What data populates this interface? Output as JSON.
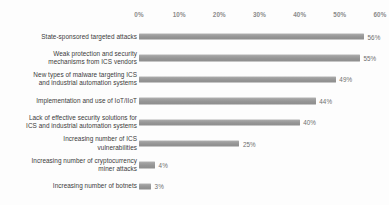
{
  "chart_data": {
    "type": "bar",
    "orientation": "horizontal",
    "title": "",
    "subtitle": "",
    "xlabel": "",
    "ylabel": "",
    "xlim": [
      0,
      60
    ],
    "grid": false,
    "legend": null,
    "axis_ticks": [
      "0%",
      "10%",
      "20%",
      "30%",
      "40%",
      "50%",
      "60%"
    ],
    "axis_tick_values": [
      0,
      10,
      20,
      30,
      40,
      50,
      60
    ],
    "axis_position": "top",
    "bar_color": "#9a9a9a",
    "label_color": "#3b3b3b",
    "tick_color": "#8b8b8b",
    "value_color": "#6f6f6f",
    "background": "#fdfdfd",
    "categories": [
      "State-sponsored targeted attacks",
      "Weak protection and security\nmechanisms from ICS vendors",
      "New types of malware targeting ICS\nand industrial automation systems",
      "Implementation and use of IoT/IIoT",
      "Lack of effective security solutions  for\nICS and industrial automation systems",
      "Increasing number of ICS\nvulnerabilities",
      "Increasing number of cryptocurrency\nminer attacks",
      "Increasing number of botnets"
    ],
    "values": [
      56,
      55,
      49,
      44,
      40,
      25,
      4,
      3
    ],
    "value_labels": [
      "56%",
      "55%",
      "49%",
      "44%",
      "40%",
      "25%",
      "4%",
      "3%"
    ]
  }
}
